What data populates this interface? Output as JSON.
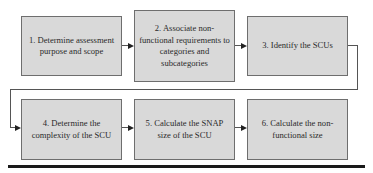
{
  "diagram": {
    "type": "process-flow",
    "steps": [
      {
        "id": 1,
        "label": "1. Determine assessment purpose and scope"
      },
      {
        "id": 2,
        "label": "2. Associate non-functional requirements to categories and subcategories"
      },
      {
        "id": 3,
        "label": "3. Identify the SCUs"
      },
      {
        "id": 4,
        "label": "4. Determine the complexity of the SCU"
      },
      {
        "id": 5,
        "label": "5. Calculate the SNAP size of the SCU"
      },
      {
        "id": 6,
        "label": "6. Calculate the non-functional size"
      }
    ],
    "edges": [
      {
        "from": 1,
        "to": 2
      },
      {
        "from": 2,
        "to": 3
      },
      {
        "from": 3,
        "to": 4
      },
      {
        "from": 4,
        "to": 5
      },
      {
        "from": 5,
        "to": 6
      }
    ],
    "colors": {
      "box_fill": "#d9d9d9",
      "box_border": "#6e6e6e",
      "connector": "#555555",
      "bottom_rule": "#1a1a1a"
    }
  }
}
